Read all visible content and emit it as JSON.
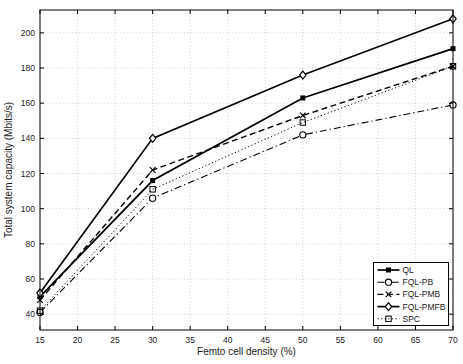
{
  "chart_data": {
    "type": "line",
    "title": "",
    "xlabel": "Femto cell density (%)",
    "ylabel": "Total system capacity (Mbits/s)",
    "x": [
      15,
      30,
      50,
      70
    ],
    "xlim": [
      15,
      70
    ],
    "ylim": [
      31,
      213
    ],
    "xticks": [
      15,
      20,
      25,
      30,
      35,
      40,
      45,
      50,
      55,
      60,
      65,
      70
    ],
    "yticks": [
      40,
      60,
      80,
      100,
      120,
      140,
      160,
      180,
      200
    ],
    "grid": "on",
    "legend_position": "lower-right",
    "background_color": "#ffffff",
    "axis_color": "#000000",
    "grid_color": "#bbbbbb",
    "series": [
      {
        "name": "QL",
        "values": [
          50,
          116,
          163,
          191
        ],
        "line": "solid",
        "marker": "filled-square",
        "color": "#000000"
      },
      {
        "name": "FQL-PB",
        "values": [
          41,
          106,
          142,
          159
        ],
        "line": "dashdot",
        "marker": "open-circle",
        "color": "#000000"
      },
      {
        "name": "FQL-PMB",
        "values": [
          48,
          122,
          153,
          181
        ],
        "line": "dashed",
        "marker": "x",
        "color": "#000000"
      },
      {
        "name": "FQL-PMFB",
        "values": [
          52,
          140,
          176,
          208
        ],
        "line": "solid",
        "marker": "open-diamond",
        "color": "#000000"
      },
      {
        "name": "SPC",
        "values": [
          42,
          111,
          149,
          181
        ],
        "line": "dotted",
        "marker": "open-square",
        "color": "#000000"
      }
    ],
    "legend_items": [
      "QL",
      "FQL-PB",
      "FQL-PMB",
      "FQL-PMFB",
      "SPC"
    ]
  }
}
